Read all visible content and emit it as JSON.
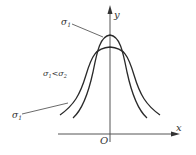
{
  "diagram": {
    "title": "",
    "axes": {
      "x_label": "x",
      "y_label": "y",
      "origin_label": "O"
    },
    "curves": [
      {
        "name": "narrow-curve",
        "label": "σ",
        "label_sub": "1",
        "description": "taller, narrower bell curve"
      },
      {
        "name": "wide-curve",
        "label": "σ",
        "label_sub": "1",
        "description": "lower, wider bell curve"
      }
    ],
    "annotation": {
      "text_a": "σ",
      "sub_a": "1",
      "relation": "<",
      "text_b": "σ",
      "sub_b": "2"
    },
    "colors": {
      "line": "#2a2a2a",
      "axis": "#555555",
      "text": "#333333",
      "background": "#ffffff"
    }
  }
}
